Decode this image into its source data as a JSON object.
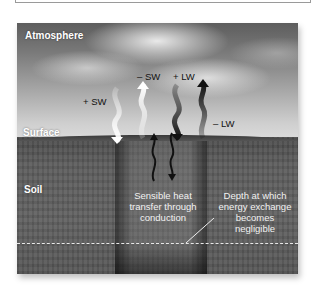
{
  "diagram": {
    "layers": {
      "atmosphere": "Atmosphere",
      "surface": "Surface",
      "soil": "Soil"
    },
    "fluxes": [
      {
        "label": "+ SW",
        "direction": "down",
        "shade": "white"
      },
      {
        "label": "– SW",
        "direction": "up",
        "shade": "white"
      },
      {
        "label": "+ LW",
        "direction": "down",
        "shade": "dark"
      },
      {
        "label": "– LW",
        "direction": "up",
        "shade": "dark"
      }
    ],
    "soil_conduction": {
      "caption_line1": "Sensible heat",
      "caption_line2": "transfer through",
      "caption_line3": "conduction",
      "arrows": [
        "up",
        "down"
      ]
    },
    "depth_note": {
      "line1": "Depth at which",
      "line2": "energy exchange",
      "line3": "becomes",
      "line4": "negligible"
    },
    "colors": {
      "sky_top": "#5d5d5d",
      "sky_bottom": "#dcdcdc",
      "soil": "#5c5c5c",
      "text_light": "#ffffff",
      "text_dark": "#111111",
      "dashed_line": "#e8e8e8"
    }
  }
}
